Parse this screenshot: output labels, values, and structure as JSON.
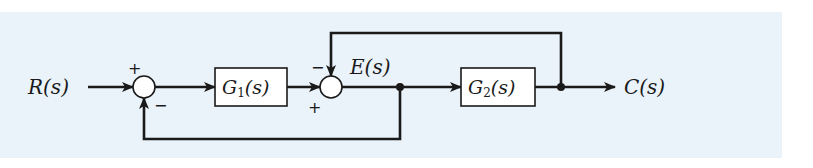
{
  "diagram": {
    "type": "block-diagram",
    "background_color": "#eaf3fa",
    "line_color": "#1a1a1a",
    "input": {
      "label": "R(s)"
    },
    "output": {
      "label": "C(s)"
    },
    "signal_label": "E(s)",
    "blocks": [
      {
        "id": "G1",
        "label_main": "G",
        "label_sub": "1",
        "label_tail": "(s)"
      },
      {
        "id": "G2",
        "label_main": "G",
        "label_sub": "2",
        "label_tail": "(s)"
      }
    ],
    "summing_junctions": [
      {
        "id": "sum1",
        "top_sign": "+",
        "bottom_sign": "−"
      },
      {
        "id": "sum2",
        "top_sign": "−",
        "bottom_sign": "+"
      }
    ],
    "connections": [
      "R(s) -> sum1 (+)",
      "sum1 -> G1",
      "G1 -> sum2 (+)",
      "sum2 -> E(s) -> G2",
      "E(s) node -> sum1 (−) [lower feedback]",
      "G2 -> C(s)",
      "C(s) node -> sum2 (−) [upper feedback]"
    ]
  }
}
